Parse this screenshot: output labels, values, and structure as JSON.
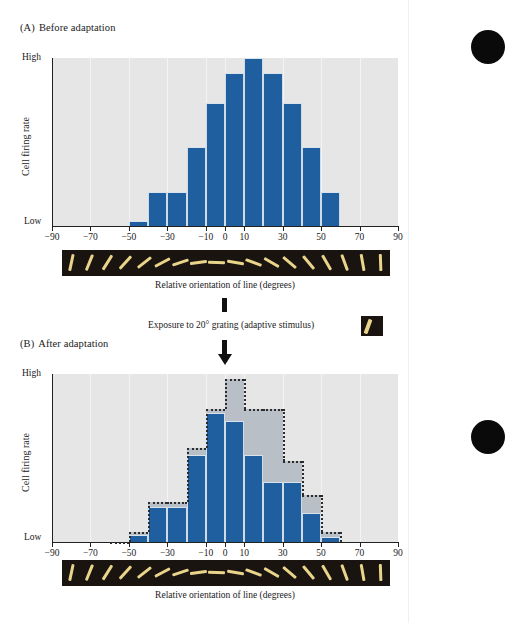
{
  "figure": {
    "seam_x": 408,
    "accent_blue": "#1f5fa0",
    "ghost_gray": "#b9bfc6",
    "plot_bg": "#e6e6e6",
    "strip_bg": "#191410",
    "strip_line": "#e9d48a"
  },
  "panel_a": {
    "label": "(A)",
    "title": "Before adaptation",
    "y_high": "High",
    "y_low": "Low",
    "y_title": "Cell firing rate",
    "x_title": "Relative orientation of line (degrees)"
  },
  "panel_b": {
    "label": "(B)",
    "title": "After adaptation",
    "y_high": "High",
    "y_low": "Low",
    "y_title": "Cell firing rate",
    "x_title": "Relative orientation of line (degrees)"
  },
  "transition": {
    "text": "Exposure to 20° grating (adaptive stimulus)",
    "stimulus_angle_deg": 20
  },
  "margin_dots": [
    {
      "cx": 488,
      "cy": 47,
      "r": 17
    },
    {
      "cx": 488,
      "cy": 437,
      "r": 17
    }
  ],
  "chart_data": [
    {
      "type": "bar",
      "id": "before-adaptation",
      "title": "Before adaptation",
      "xlabel": "Relative orientation of line (degrees)",
      "ylabel": "Cell firing rate",
      "xlim": [
        -90,
        90
      ],
      "ylim": [
        0,
        1
      ],
      "ytick_labels": [
        "Low",
        "High"
      ],
      "xtick_labels": [
        "-90",
        "-70",
        "-50",
        "-30",
        "-10",
        "0",
        "10",
        "30",
        "50",
        "70",
        "90"
      ],
      "xticks": [
        -90,
        -70,
        -50,
        -30,
        -10,
        0,
        10,
        30,
        50,
        70,
        90
      ],
      "grid": true,
      "legend": "none",
      "bin_width_deg": 10,
      "bin_centers": [
        -55,
        -45,
        -35,
        -25,
        -15,
        -5,
        5,
        15,
        25,
        35,
        45,
        55
      ],
      "values": [
        0.0,
        0.03,
        0.2,
        0.2,
        0.47,
        0.73,
        0.91,
        1.0,
        0.91,
        0.73,
        0.47,
        0.2
      ]
    },
    {
      "type": "bar",
      "id": "after-adaptation",
      "title": "After adaptation",
      "xlabel": "Relative orientation of line (degrees)",
      "ylabel": "Cell firing rate",
      "xlim": [
        -90,
        90
      ],
      "ylim": [
        0,
        1
      ],
      "ytick_labels": [
        "Low",
        "High"
      ],
      "xtick_labels": [
        "-90",
        "-70",
        "-50",
        "-30",
        "-10",
        "0",
        "10",
        "30",
        "50",
        "70",
        "90"
      ],
      "xticks": [
        -90,
        -70,
        -50,
        -30,
        -10,
        0,
        10,
        30,
        50,
        70,
        90
      ],
      "grid": true,
      "legend": "none",
      "bin_width_deg": 10,
      "bin_centers": [
        -55,
        -45,
        -35,
        -25,
        -15,
        -5,
        5,
        15,
        25,
        35,
        45,
        55
      ],
      "series": [
        {
          "name": "After adaptation",
          "style": "solid-blue",
          "values": [
            0.0,
            0.04,
            0.21,
            0.21,
            0.52,
            0.77,
            0.72,
            0.52,
            0.36,
            0.36,
            0.17,
            0.03
          ]
        },
        {
          "name": "Before adaptation (reference outline)",
          "style": "dotted-outline-gray",
          "values": [
            0.0,
            0.06,
            0.24,
            0.24,
            0.56,
            0.79,
            0.97,
            0.79,
            0.79,
            0.48,
            0.28,
            0.06
          ]
        }
      ]
    }
  ],
  "grating_strip": {
    "count": 18,
    "angles_deg": [
      -78,
      -68,
      -58,
      -48,
      -38,
      -28,
      -18,
      -8,
      2,
      10,
      20,
      30,
      40,
      50,
      60,
      70,
      80,
      88
    ]
  }
}
